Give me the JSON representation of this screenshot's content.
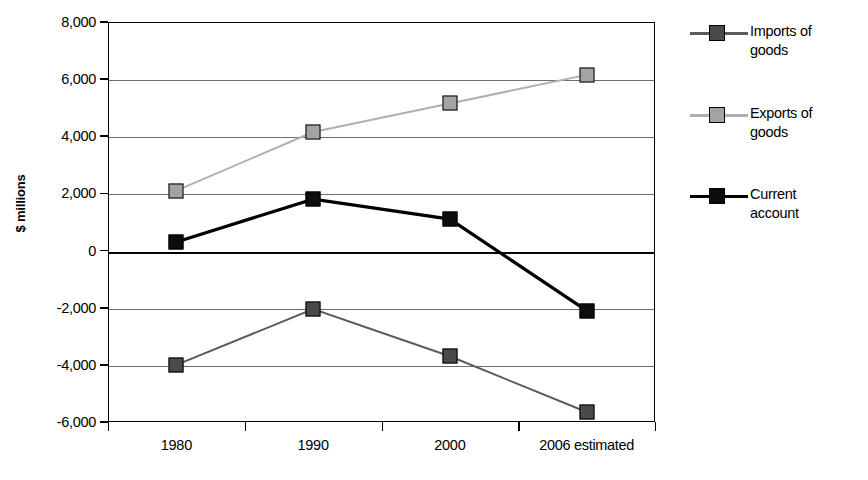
{
  "chart_data": {
    "type": "line",
    "title": "",
    "subtitle": "",
    "xlabel": "",
    "ylabel": "$ millions",
    "categories": [
      "1980",
      "1990",
      "2000",
      "2006 estimated"
    ],
    "ylim": [
      -6000,
      8000
    ],
    "ytick_step": 2000,
    "yticks": [
      8000,
      6000,
      4000,
      2000,
      0,
      -2000,
      -4000,
      -6000
    ],
    "ytick_labels": [
      "8,000",
      "6,000",
      "4,000",
      "2,000",
      "0",
      "-2,000",
      "-4,000",
      "-6,000"
    ],
    "grid": true,
    "zero_line": true,
    "legend_position": "right",
    "marker": "square",
    "series": [
      {
        "name": "Imports of goods",
        "label_lines": [
          "Imports of",
          "goods"
        ],
        "color": "#4a4a4a",
        "marker_color": "#4a4a4a",
        "line_color": "#5b5b5b",
        "values": [
          -4000,
          -2050,
          -3700,
          -5650
        ]
      },
      {
        "name": "Exports of goods",
        "label_lines": [
          "Exports of",
          "goods"
        ],
        "color": "#a0a0a0",
        "marker_color": "#a3a3a3",
        "line_color": "#b0b0b0",
        "values": [
          2100,
          4150,
          5150,
          6150
        ]
      },
      {
        "name": "Current account",
        "label_lines": [
          "Current",
          "account"
        ],
        "color": "#000000",
        "marker_color": "#0d0d0d",
        "line_color": "#000000",
        "values": [
          300,
          1800,
          1100,
          -2100
        ]
      }
    ]
  },
  "axis": {
    "y_title": "$ millions"
  }
}
